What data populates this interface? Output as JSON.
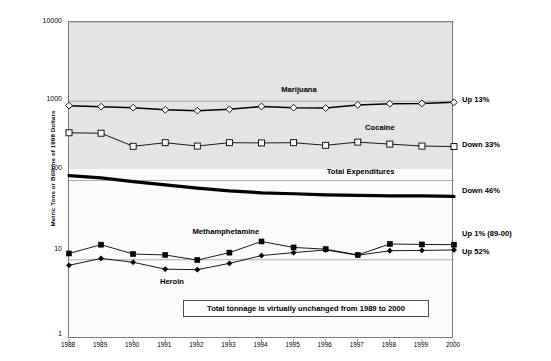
{
  "chart_data": {
    "type": "line",
    "title": "",
    "xlabel": "",
    "ylabel": "Metric Tons or Billions of 1998 Dollars",
    "yscale": "log",
    "ylim": [
      1,
      10000
    ],
    "ytick_labels": [
      "10000",
      "1000",
      "100",
      "10",
      "1"
    ],
    "grid": true,
    "legend_position": "inline-labels",
    "categories": [
      "1988",
      "1989",
      "1990",
      "1991",
      "1992",
      "1993",
      "1994",
      "1995",
      "1996",
      "1997",
      "1998",
      "1999",
      "2000"
    ],
    "series": [
      {
        "name": "Marijuana",
        "marker": "open-diamond",
        "values": [
          880,
          855,
          830,
          780,
          760,
          790,
          860,
          830,
          820,
          900,
          930,
          940,
          970
        ]
      },
      {
        "name": "Cocaine",
        "marker": "open-square",
        "values": [
          400,
          395,
          270,
          300,
          272,
          300,
          298,
          300,
          278,
          305,
          288,
          272,
          268
        ]
      },
      {
        "name": "Total Expenditures",
        "marker": "none",
        "values": [
          115,
          108,
          97,
          88,
          80,
          74,
          70,
          68,
          66,
          65,
          64,
          64,
          63
        ]
      },
      {
        "name": "Methamphetamine",
        "marker": "filled-square",
        "values": [
          12.0,
          15.5,
          11.8,
          11.5,
          9.9,
          12.3,
          17.0,
          14.3,
          13.6,
          11.5,
          15.8,
          15.6,
          15.5
        ]
      },
      {
        "name": "Heroin",
        "marker": "filled-diamond",
        "values": [
          8.5,
          10.4,
          9.3,
          7.6,
          7.5,
          9.0,
          11.3,
          12.3,
          13.3,
          11.4,
          13.0,
          13.1,
          13.3
        ]
      }
    ],
    "inline_labels": [
      {
        "text": "Marijuana",
        "x_frac": 0.6,
        "y_px": 85
      },
      {
        "text": "Cocaine",
        "x_frac": 0.81,
        "y_px": 123
      },
      {
        "text": "Total Expenditures",
        "x_frac": 0.76,
        "y_px": 167
      },
      {
        "text": "Methamphetamine",
        "x_frac": 0.41,
        "y_px": 227
      },
      {
        "text": "Heroin",
        "x_frac": 0.27,
        "y_px": 277
      }
    ],
    "annotations_right": [
      {
        "text": "Up 13%",
        "y_px": 95
      },
      {
        "text": "Down 33%",
        "y_px": 140
      },
      {
        "text": "Down 46%",
        "y_px": 186
      },
      {
        "text": "Up 1% (89-00)",
        "y_px": 229
      },
      {
        "text": "Up 52%",
        "y_px": 247
      }
    ],
    "callout": "Total tonnage is virtually unchanged from 1989 to 2000",
    "colors": {
      "plot_upper_bg": "#e4e4e4",
      "plot_lower_bg": "#fbfbfb",
      "grid": "#9a9a9a",
      "frame": "#7a7a7a",
      "series": "#000000"
    }
  }
}
